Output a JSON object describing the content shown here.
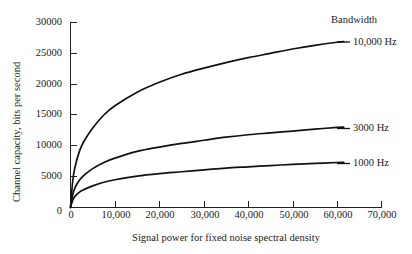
{
  "chart_data": {
    "type": "line",
    "title": "",
    "xlabel": "Signal power for fixed noise spectral density",
    "ylabel": "Channel capacity, bits per second",
    "xlim": [
      0,
      70000
    ],
    "ylim": [
      0,
      30000
    ],
    "grid": false,
    "legend_position": "right-inline",
    "legend_title": "Bandwidth",
    "xticks": [
      0,
      10000,
      20000,
      30000,
      40000,
      50000,
      60000,
      70000
    ],
    "xticklabels": [
      "0",
      "10,000",
      "20,000",
      "30,000",
      "40,000",
      "50,000",
      "60,000",
      "70,000"
    ],
    "yticks": [
      0,
      5000,
      10000,
      15000,
      20000,
      25000,
      30000
    ],
    "yticklabels": [
      "0",
      "5000",
      "10000",
      "15000",
      "20000",
      "25000",
      "30000"
    ],
    "x": [
      0,
      500,
      1000,
      2000,
      3000,
      5000,
      7500,
      10000,
      15000,
      20000,
      25000,
      30000,
      35000,
      40000,
      45000,
      50000,
      55000,
      60000,
      61500
    ],
    "series": [
      {
        "name": "10,000 Hz",
        "label": "10,000 Hz",
        "color": "#111111",
        "values": [
          0,
          5200,
          7900,
          11000,
          12900,
          15600,
          18100,
          19900,
          22600,
          24500,
          26000,
          27300,
          28400,
          29300,
          30200,
          31000,
          31700,
          32400,
          32600
        ],
        "values_plotted": [
          0,
          4300,
          6500,
          9100,
          10700,
          12900,
          15000,
          16500,
          18700,
          20300,
          21600,
          22600,
          23500,
          24300,
          25000,
          25700,
          26300,
          26800,
          26900
        ]
      },
      {
        "name": "3000 Hz",
        "label": "3000 Hz",
        "color": "#111111",
        "values_plotted": [
          0,
          2100,
          3200,
          4400,
          5200,
          6300,
          7300,
          8000,
          9100,
          9800,
          10400,
          10900,
          11400,
          11800,
          12100,
          12400,
          12700,
          13000,
          13050
        ]
      },
      {
        "name": "1000 Hz",
        "label": "1000 Hz",
        "color": "#111111",
        "values_plotted": [
          0,
          1200,
          1800,
          2500,
          2900,
          3500,
          4100,
          4500,
          5100,
          5500,
          5800,
          6100,
          6400,
          6600,
          6800,
          7000,
          7150,
          7300,
          7330
        ]
      }
    ],
    "annotations": [
      {
        "text": "Bandwidth",
        "role": "legend-title"
      },
      {
        "text": "10,000 Hz",
        "role": "series-callout",
        "series": "10,000 Hz"
      },
      {
        "text": "3000 Hz",
        "role": "series-callout",
        "series": "3000 Hz"
      },
      {
        "text": "1000 Hz",
        "role": "series-callout",
        "series": "1000 Hz"
      }
    ]
  },
  "axes": {
    "y_title": "Channel capacity, bits per second",
    "x_title": "Signal power for fixed noise spectral density",
    "y_labels": [
      "30000",
      "25000",
      "20000",
      "15000",
      "10000",
      "5000",
      "0"
    ],
    "x_labels": [
      "0",
      "10,000",
      "20,000",
      "30,000",
      "40,000",
      "50,000",
      "60,000",
      "70,000"
    ]
  },
  "legend": {
    "title": "Bandwidth",
    "entries": [
      "10,000 Hz",
      "3000 Hz",
      "1000 Hz"
    ]
  }
}
